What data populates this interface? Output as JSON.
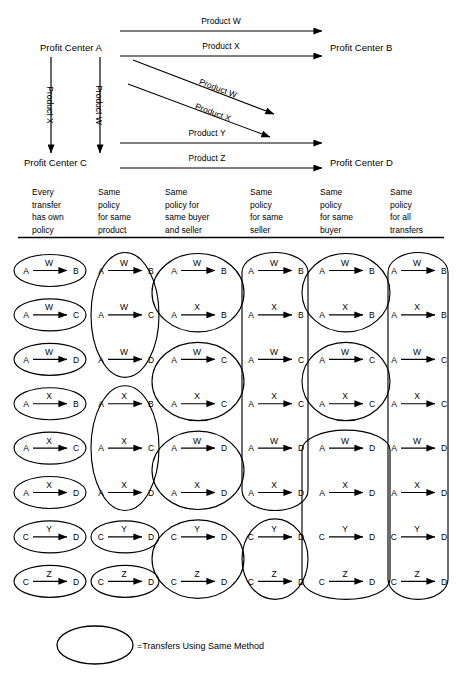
{
  "figure": {
    "title_present": false,
    "type": "transfer-pricing-policy-diagram"
  },
  "top_diagram": {
    "centers": [
      {
        "id": "A",
        "label": "Profit Center A"
      },
      {
        "id": "B",
        "label": "Profit Center B"
      },
      {
        "id": "C",
        "label": "Profit Center C"
      },
      {
        "id": "D",
        "label": "Profit Center D"
      }
    ],
    "flows": [
      {
        "from": "A",
        "to": "B",
        "product": "Product W",
        "orientation": "horizontal"
      },
      {
        "from": "A",
        "to": "B",
        "product": "Product X",
        "orientation": "horizontal"
      },
      {
        "from": "A",
        "to": "C",
        "product": "Product X",
        "orientation": "vertical"
      },
      {
        "from": "A",
        "to": "C",
        "product": "Product W",
        "orientation": "vertical"
      },
      {
        "from": "A",
        "to": "D",
        "product": "Product W",
        "orientation": "diagonal"
      },
      {
        "from": "A",
        "to": "D",
        "product": "Product X",
        "orientation": "diagonal"
      },
      {
        "from": "C",
        "to": "D",
        "product": "Product Y",
        "orientation": "horizontal"
      },
      {
        "from": "C",
        "to": "D",
        "product": "Product Z",
        "orientation": "horizontal"
      }
    ]
  },
  "columns": [
    {
      "index": 1,
      "header_lines": [
        "Every",
        "transfer",
        "has own",
        "policy"
      ],
      "header_text": "Every transfer has own policy"
    },
    {
      "index": 2,
      "header_lines": [
        "Same",
        "policy",
        "for same",
        "product"
      ],
      "header_text": "Same policy for same product"
    },
    {
      "index": 3,
      "header_lines": [
        "Same",
        "policy for",
        "same buyer",
        "and seller"
      ],
      "header_text": "Same policy for same buyer and seller"
    },
    {
      "index": 4,
      "header_lines": [
        "Same",
        "policy",
        "for same",
        "seller"
      ],
      "header_text": "Same policy for same seller"
    },
    {
      "index": 5,
      "header_lines": [
        "Same",
        "policy",
        "for same",
        "buyer"
      ],
      "header_text": "Same policy for same buyer"
    },
    {
      "index": 6,
      "header_lines": [
        "Same",
        "policy",
        "for all",
        "transfers"
      ],
      "header_text": "Same policy for all transfers"
    }
  ],
  "matrix": {
    "row_count": 8,
    "col1": {
      "transfers": [
        {
          "from": "A",
          "product": "W",
          "to": "B"
        },
        {
          "from": "A",
          "product": "W",
          "to": "C"
        },
        {
          "from": "A",
          "product": "W",
          "to": "D"
        },
        {
          "from": "A",
          "product": "X",
          "to": "B"
        },
        {
          "from": "A",
          "product": "X",
          "to": "C"
        },
        {
          "from": "A",
          "product": "X",
          "to": "D"
        },
        {
          "from": "C",
          "product": "Y",
          "to": "D"
        },
        {
          "from": "C",
          "product": "Z",
          "to": "D"
        }
      ],
      "groups": [
        [
          0
        ],
        [
          1
        ],
        [
          2
        ],
        [
          3
        ],
        [
          4
        ],
        [
          5
        ],
        [
          6
        ],
        [
          7
        ]
      ]
    },
    "col2": {
      "transfers": [
        {
          "from": "A",
          "product": "W",
          "to": "B"
        },
        {
          "from": "A",
          "product": "W",
          "to": "C"
        },
        {
          "from": "A",
          "product": "W",
          "to": "D"
        },
        {
          "from": "A",
          "product": "X",
          "to": "B"
        },
        {
          "from": "A",
          "product": "X",
          "to": "C"
        },
        {
          "from": "A",
          "product": "X",
          "to": "D"
        },
        {
          "from": "C",
          "product": "Y",
          "to": "D"
        },
        {
          "from": "C",
          "product": "Z",
          "to": "D"
        }
      ],
      "groups": [
        [
          0,
          1,
          2
        ],
        [
          3,
          4,
          5
        ],
        [
          6
        ],
        [
          7
        ]
      ]
    },
    "col3": {
      "transfers": [
        {
          "from": "A",
          "product": "W",
          "to": "B"
        },
        {
          "from": "A",
          "product": "X",
          "to": "B"
        },
        {
          "from": "A",
          "product": "W",
          "to": "C"
        },
        {
          "from": "A",
          "product": "X",
          "to": "C"
        },
        {
          "from": "A",
          "product": "W",
          "to": "D"
        },
        {
          "from": "A",
          "product": "X",
          "to": "D"
        },
        {
          "from": "C",
          "product": "Y",
          "to": "D"
        },
        {
          "from": "C",
          "product": "Z",
          "to": "D"
        }
      ],
      "groups": [
        [
          0,
          1
        ],
        [
          2,
          3
        ],
        [
          4,
          5
        ],
        [
          6,
          7
        ]
      ]
    },
    "col4": {
      "transfers": [
        {
          "from": "A",
          "product": "W",
          "to": "B"
        },
        {
          "from": "A",
          "product": "X",
          "to": "B"
        },
        {
          "from": "A",
          "product": "W",
          "to": "C"
        },
        {
          "from": "A",
          "product": "X",
          "to": "C"
        },
        {
          "from": "A",
          "product": "W",
          "to": "D"
        },
        {
          "from": "A",
          "product": "X",
          "to": "D"
        },
        {
          "from": "C",
          "product": "Y",
          "to": "D"
        },
        {
          "from": "C",
          "product": "Z",
          "to": "D"
        }
      ],
      "groups": [
        [
          0,
          1,
          2,
          3,
          4,
          5
        ],
        [
          6,
          7
        ]
      ]
    },
    "col5": {
      "transfers": [
        {
          "from": "A",
          "product": "W",
          "to": "B"
        },
        {
          "from": "A",
          "product": "X",
          "to": "B"
        },
        {
          "from": "A",
          "product": "W",
          "to": "C"
        },
        {
          "from": "A",
          "product": "X",
          "to": "C"
        },
        {
          "from": "A",
          "product": "W",
          "to": "D"
        },
        {
          "from": "A",
          "product": "X",
          "to": "D"
        },
        {
          "from": "C",
          "product": "Y",
          "to": "D"
        },
        {
          "from": "C",
          "product": "Z",
          "to": "D"
        }
      ],
      "groups": [
        [
          0,
          1
        ],
        [
          2,
          3
        ],
        [
          4,
          5,
          6,
          7
        ]
      ]
    },
    "col6": {
      "transfers": [
        {
          "from": "A",
          "product": "W",
          "to": "B"
        },
        {
          "from": "A",
          "product": "X",
          "to": "B"
        },
        {
          "from": "A",
          "product": "W",
          "to": "C"
        },
        {
          "from": "A",
          "product": "X",
          "to": "C"
        },
        {
          "from": "A",
          "product": "W",
          "to": "D"
        },
        {
          "from": "A",
          "product": "X",
          "to": "D"
        },
        {
          "from": "C",
          "product": "Y",
          "to": "D"
        },
        {
          "from": "C",
          "product": "Z",
          "to": "D"
        }
      ],
      "groups": [
        [
          0,
          1,
          2,
          3,
          4,
          5,
          6,
          7
        ]
      ]
    }
  },
  "legend": {
    "shape": "ellipse",
    "text": "=Transfers Using Same Method"
  },
  "colors": {
    "stroke": "#000000",
    "background": "#ffffff"
  }
}
